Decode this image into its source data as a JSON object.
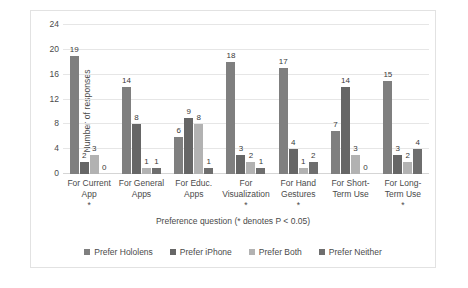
{
  "chart_data": {
    "type": "bar",
    "title": "",
    "xlabel": "Preference question (* denotes P < 0.05)",
    "ylabel": "Number of responses",
    "ylim": [
      0,
      24
    ],
    "yticks": [
      0,
      4,
      8,
      12,
      16,
      20,
      24
    ],
    "grid": true,
    "legend_position": "bottom",
    "categories": [
      "For Current App",
      "For General Apps",
      "For Educ. Apps",
      "For Visualization",
      "For Hand Gestures",
      "For Short-Term Use",
      "For Long-Term Use"
    ],
    "category_lines": [
      [
        "For Current",
        "App"
      ],
      [
        "For General",
        "Apps"
      ],
      [
        "For Educ.",
        "Apps"
      ],
      [
        "For",
        "Visualization"
      ],
      [
        "For Hand",
        "Gestures"
      ],
      [
        "For Short-",
        "Term Use"
      ],
      [
        "For Long-",
        "Term Use"
      ]
    ],
    "category_significance": [
      true,
      false,
      false,
      true,
      true,
      false,
      true
    ],
    "significance_marker": "*",
    "series": [
      {
        "name": "Prefer Hololens",
        "color": "#7f7f7f",
        "values": [
          19,
          14,
          6,
          18,
          17,
          7,
          15
        ]
      },
      {
        "name": "Prefer iPhone",
        "color": "#666666",
        "values": [
          2,
          8,
          9,
          3,
          4,
          14,
          3
        ]
      },
      {
        "name": "Prefer Both",
        "color": "#b2b2b2",
        "values": [
          3,
          1,
          8,
          2,
          1,
          3,
          2
        ]
      },
      {
        "name": "Prefer Neither",
        "color": "#6e6e6e",
        "values": [
          0,
          1,
          1,
          1,
          2,
          0,
          4
        ]
      }
    ]
  }
}
